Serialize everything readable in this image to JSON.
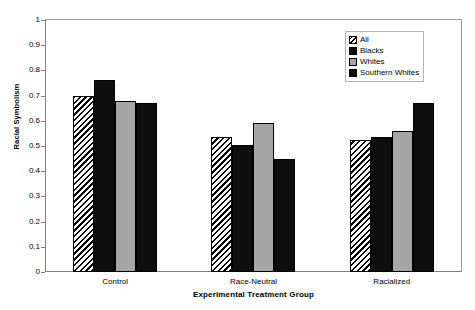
{
  "chart_data": {
    "type": "bar",
    "title": "",
    "xlabel": "Experimental Treatment Group",
    "ylabel": "Racial Symbolism",
    "categories": [
      "Control",
      "Race-Neutral",
      "Racialized"
    ],
    "series": [
      {
        "name": "All",
        "values": [
          0.7,
          0.535,
          0.525
        ],
        "fill": "hatch",
        "color": "#000000"
      },
      {
        "name": "Blacks",
        "values": [
          0.76,
          0.505,
          0.535
        ],
        "fill": "solid-dark",
        "color": "#0d0d0d"
      },
      {
        "name": "Whites",
        "values": [
          0.68,
          0.59,
          0.56
        ],
        "fill": "solid-gray",
        "color": "#a6a6a6"
      },
      {
        "name": "Southern Whites",
        "values": [
          0.67,
          0.45,
          0.67
        ],
        "fill": "solid-dark",
        "color": "#0d0d0d"
      }
    ],
    "ylim": [
      0,
      1
    ],
    "ytick_labels": [
      "1",
      "0.9",
      "0.8",
      "0.7",
      "0.6",
      "0.5",
      "0.4",
      "0.3",
      "0.2",
      "0.1",
      "0"
    ],
    "ytick_values": [
      1,
      0.9,
      0.8,
      0.7,
      0.6,
      0.5,
      0.4,
      0.3,
      0.2,
      0.1,
      0
    ],
    "grid": false,
    "legend_position": "top-right",
    "legend_entries": [
      "All",
      "Blacks",
      "Whites",
      "Southern Whites"
    ]
  },
  "axes": {
    "y_title": "Racial Symbolism",
    "x_title": "Experimental Treatment Group"
  },
  "legend": {
    "items": [
      {
        "label": "All",
        "swatch": "hatch-swatch"
      },
      {
        "label": "Blacks",
        "swatch": "black-swatch"
      },
      {
        "label": "Whites",
        "swatch": "gray-swatch"
      },
      {
        "label": "Southern Whites",
        "swatch": "black-swatch"
      }
    ]
  },
  "top_title": ""
}
